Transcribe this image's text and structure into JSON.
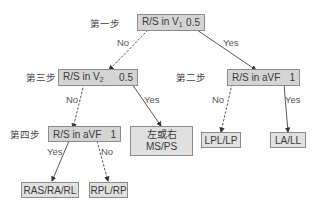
{
  "diagram": {
    "type": "decision-tree",
    "steps": {
      "step1": "第一步",
      "step2": "第二步",
      "step3": "第三步",
      "step4": "第四步"
    },
    "nodes": {
      "n1": {
        "lead": "R/S  in V",
        "sub": "1",
        "value": "0.5"
      },
      "n2": {
        "lead": "R/S in aVF",
        "value": "1"
      },
      "n3": {
        "lead": "R/S in V",
        "sub": "2",
        "value": "0.5"
      },
      "n4": {
        "lead": "R/S in aVF",
        "value": "1"
      },
      "leaf_ms": {
        "line1": "左或右",
        "line2": "MS/PS"
      },
      "leaf_lpl": {
        "label": "LPL/LP"
      },
      "leaf_la": {
        "label": "LA/LL"
      },
      "leaf_ras": {
        "label": "RAS/RA/RL"
      },
      "leaf_rpl": {
        "label": "RPL/RP"
      }
    },
    "edges": {
      "n1_no": "No",
      "n1_yes": "Yes",
      "n3_no": "No",
      "n3_yes": "Yes",
      "n2_no": "No",
      "n2_yes": "Yes",
      "n4_yes": "Yes",
      "n4_no": "No"
    },
    "colors": {
      "node_fill": "#d4d4d4",
      "leaf_fill": "#e0e0e0",
      "border": "#8c8c8c",
      "arrow": "#333333"
    }
  }
}
